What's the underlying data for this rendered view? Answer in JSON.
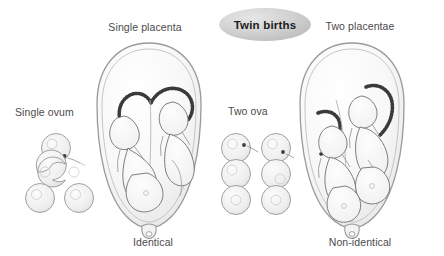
{
  "figure": {
    "title": "Twin births",
    "width": 444,
    "height": 256,
    "background_color": "#ffffff",
    "label_color": "#4a4a4a",
    "title_color": "#1c1c1c",
    "badge_color": "#c9c9c9",
    "outline_color": "#6e6e6e",
    "fill_color": "#f4f4f4"
  },
  "labels": {
    "single_placenta": "Single placenta",
    "two_placentae": "Two placentae",
    "single_ovum": "Single ovum",
    "two_ova": "Two ova",
    "identical": "Identical",
    "non_identical": "Non-identical"
  },
  "panels": [
    {
      "id": "left",
      "top_label": "Single placenta",
      "side_label": "Single ovum",
      "bottom_label": "Identical",
      "placenta_count": 1,
      "ovum_count": 1,
      "fetus_count": 2,
      "cell_stages": [
        {
          "stage": "single fertilised ovum",
          "cells": 1
        },
        {
          "stage": "dividing ovum",
          "cells": 2
        },
        {
          "stage": "two separated cells",
          "cells": 2
        }
      ]
    },
    {
      "id": "right",
      "top_label": "Two placentae",
      "side_label": "Two ova",
      "bottom_label": "Non-identical",
      "placenta_count": 2,
      "ovum_count": 2,
      "fetus_count": 2,
      "cell_stages": [
        {
          "stage": "two ova fertilised",
          "cells": 2
        },
        {
          "stage": "two separate zygotes",
          "cells": 2
        },
        {
          "stage": "two separate embryos",
          "cells": 2
        }
      ]
    }
  ]
}
